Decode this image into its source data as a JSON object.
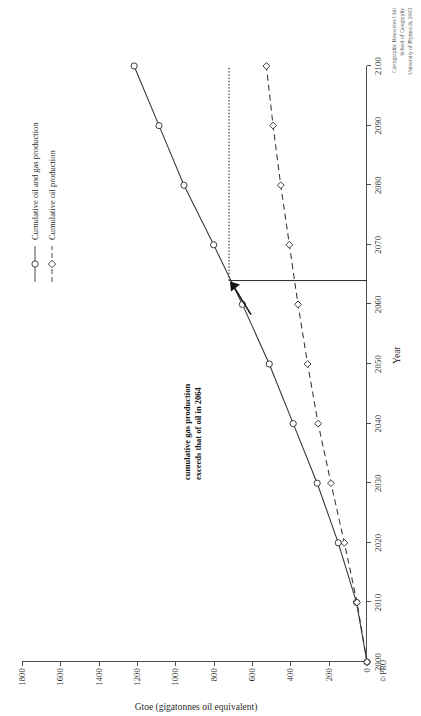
{
  "chart_data": {
    "type": "line",
    "title": "",
    "xlabel": "Year",
    "ylabel": "Gtoe (gigatonnes oil equivalent)",
    "xlim": [
      2000,
      2100
    ],
    "ylim": [
      0,
      1800
    ],
    "xticks": [
      2000,
      2010,
      2020,
      2030,
      2040,
      2050,
      2060,
      2070,
      2080,
      2090,
      2100
    ],
    "yticks": [
      0,
      200,
      400,
      600,
      800,
      1000,
      1200,
      1400,
      1600,
      1800
    ],
    "grid": false,
    "legend_position": "top-right-inside",
    "x": [
      2000,
      2010,
      2020,
      2030,
      2040,
      2050,
      2060,
      2070,
      2080,
      2090,
      2100
    ],
    "series": [
      {
        "name": "Cumulative oil and gas production",
        "marker": "circle",
        "linestyle": "solid",
        "color": "#333333",
        "values": [
          0,
          55,
          150,
          260,
          385,
          510,
          650,
          800,
          955,
          1085,
          1215
        ]
      },
      {
        "name": "Cumulative oil production",
        "marker": "diamond",
        "linestyle": "dashed",
        "color": "#333333",
        "values": [
          0,
          52,
          118,
          188,
          255,
          310,
          360,
          405,
          450,
          490,
          525
        ]
      }
    ],
    "annotations": [
      {
        "text_line1": "cumulative gas production",
        "text_line2": "exceeds that of oil in 2064",
        "point_x": 2064,
        "point_y": 720
      }
    ],
    "guide_lines": {
      "intersection_year": 2064,
      "intersection_value": 720,
      "note": "dotted horizontal line at the crossing value plus a vertical drop at 2064"
    }
  },
  "axes": {
    "x_title": "Year",
    "y_title": "Gtoe (gigatonnes oil equivalent)",
    "x_tick_labels": [
      "2000",
      "2010",
      "2020",
      "2030",
      "2040",
      "2050",
      "2060",
      "2070",
      "2080",
      "2090",
      "2100"
    ],
    "y_tick_labels": [
      "0",
      "200",
      "400",
      "600",
      "800",
      "1000",
      "1200",
      "1400",
      "1600",
      "1800"
    ]
  },
  "legend": {
    "items": [
      {
        "label": "Cumulative oil and gas production",
        "marker": "circle-marker",
        "style": "solid"
      },
      {
        "label": "Cumulative oil production",
        "marker": "diamond-marker",
        "style": "dashed"
      }
    ]
  },
  "annotation": {
    "line1": "cumulative gas production",
    "line2": "exceeds that of oil in 2064"
  },
  "credit": {
    "line1": "Cartographic Resources Unit",
    "line2": "School of Geography",
    "line3": "University of Plymouth, 2003"
  },
  "copyright": {
    "mark": "© PRO"
  },
  "colors": {
    "axis": "#4d4d4d",
    "line": "#333333",
    "text": "#2b2b2b",
    "credit_text": "#555555",
    "background": "#ffffff"
  }
}
